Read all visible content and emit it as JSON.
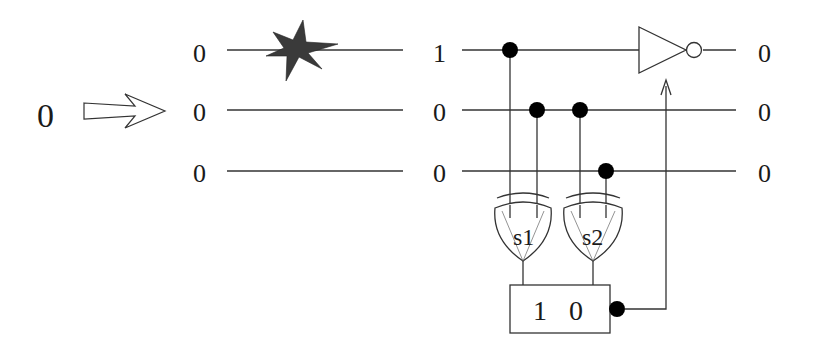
{
  "diagram": {
    "input_bit": "0",
    "encoded_bits": [
      "0",
      "0",
      "0"
    ],
    "after_error_bits": [
      "1",
      "0",
      "0"
    ],
    "output_bits": [
      "0",
      "0",
      "0"
    ],
    "syndrome_gates": [
      {
        "label": "s1"
      },
      {
        "label": "s2"
      }
    ],
    "syndrome_register": {
      "bits": [
        "1",
        "0"
      ]
    },
    "colors": {
      "wire": "#333333",
      "error_star": "#3a3a3a",
      "control_dot": "#000000"
    }
  }
}
